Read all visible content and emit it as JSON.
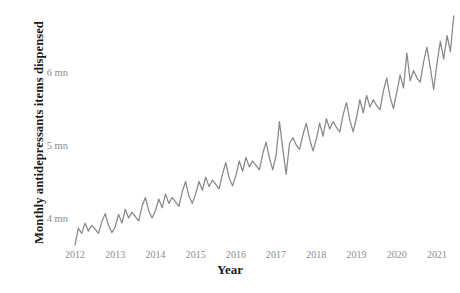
{
  "chart_data": {
    "type": "line",
    "title": "",
    "xlabel": "Year",
    "ylabel": "Monthly antidepressants items dispensed",
    "xlim": [
      2011.92,
      2021.6
    ],
    "ylim": [
      3.45,
      6.85
    ],
    "grid": false,
    "legend": false,
    "line_color": "#888888",
    "tick_color": "#8c8c8c",
    "label_color": "#1a1a1a",
    "background": "#ffffff",
    "xticks": [
      {
        "value": 2012,
        "label": "2012"
      },
      {
        "value": 2013,
        "label": "2013"
      },
      {
        "value": 2014,
        "label": "2014"
      },
      {
        "value": 2015,
        "label": "2015"
      },
      {
        "value": 2016,
        "label": "2016"
      },
      {
        "value": 2017,
        "label": "2017"
      },
      {
        "value": 2018,
        "label": "2018"
      },
      {
        "value": 2019,
        "label": "2019"
      },
      {
        "value": 2020,
        "label": "2020"
      },
      {
        "value": 2021,
        "label": "2021"
      }
    ],
    "yticks": [
      {
        "value": 4,
        "label": "4 mn"
      },
      {
        "value": 5,
        "label": "5 mn"
      },
      {
        "value": 6,
        "label": "6 mn"
      }
    ],
    "series": [
      {
        "name": "Monthly antidepressants items dispensed",
        "units": "millions of items",
        "x": [
          2012.0,
          2012.083,
          2012.167,
          2012.25,
          2012.333,
          2012.417,
          2012.5,
          2012.583,
          2012.667,
          2012.75,
          2012.833,
          2012.917,
          2013.0,
          2013.083,
          2013.167,
          2013.25,
          2013.333,
          2013.417,
          2013.5,
          2013.583,
          2013.667,
          2013.75,
          2013.833,
          2013.917,
          2014.0,
          2014.083,
          2014.167,
          2014.25,
          2014.333,
          2014.417,
          2014.5,
          2014.583,
          2014.667,
          2014.75,
          2014.833,
          2014.917,
          2015.0,
          2015.083,
          2015.167,
          2015.25,
          2015.333,
          2015.417,
          2015.5,
          2015.583,
          2015.667,
          2015.75,
          2015.833,
          2015.917,
          2016.0,
          2016.083,
          2016.167,
          2016.25,
          2016.333,
          2016.417,
          2016.5,
          2016.583,
          2016.667,
          2016.75,
          2016.833,
          2016.917,
          2017.0,
          2017.083,
          2017.167,
          2017.25,
          2017.333,
          2017.417,
          2017.5,
          2017.583,
          2017.667,
          2017.75,
          2017.833,
          2017.917,
          2018.0,
          2018.083,
          2018.167,
          2018.25,
          2018.333,
          2018.417,
          2018.5,
          2018.583,
          2018.667,
          2018.75,
          2018.833,
          2018.917,
          2019.0,
          2019.083,
          2019.167,
          2019.25,
          2019.333,
          2019.417,
          2019.5,
          2019.583,
          2019.667,
          2019.75,
          2019.833,
          2019.917,
          2020.0,
          2020.083,
          2020.167,
          2020.25,
          2020.333,
          2020.417,
          2020.5,
          2020.583,
          2020.667,
          2020.75,
          2020.833,
          2020.917,
          2021.0,
          2021.083,
          2021.167,
          2021.25,
          2021.333,
          2021.417
        ],
        "values": [
          3.63,
          3.86,
          3.79,
          3.93,
          3.82,
          3.9,
          3.85,
          3.79,
          3.95,
          4.06,
          3.9,
          3.8,
          3.88,
          4.05,
          3.93,
          4.12,
          4.0,
          4.08,
          4.02,
          3.96,
          4.16,
          4.28,
          4.1,
          4.0,
          4.1,
          4.26,
          4.14,
          4.33,
          4.2,
          4.28,
          4.22,
          4.16,
          4.36,
          4.5,
          4.3,
          4.2,
          4.33,
          4.5,
          4.38,
          4.56,
          4.43,
          4.52,
          4.46,
          4.4,
          4.6,
          4.76,
          4.55,
          4.44,
          4.58,
          4.78,
          4.64,
          4.83,
          4.7,
          4.78,
          4.72,
          4.66,
          4.88,
          5.04,
          4.82,
          4.66,
          4.86,
          5.32,
          4.94,
          4.6,
          5.02,
          5.1,
          5.0,
          4.94,
          5.14,
          5.3,
          5.08,
          4.92,
          5.08,
          5.3,
          5.12,
          5.36,
          5.22,
          5.32,
          5.24,
          5.18,
          5.42,
          5.58,
          5.34,
          5.18,
          5.38,
          5.62,
          5.44,
          5.68,
          5.52,
          5.62,
          5.54,
          5.48,
          5.74,
          5.92,
          5.66,
          5.5,
          5.72,
          5.96,
          5.78,
          6.26,
          5.88,
          6.02,
          5.92,
          5.86,
          6.14,
          6.34,
          6.06,
          5.76,
          6.12,
          6.42,
          6.18,
          6.5,
          6.28,
          6.77
        ]
      }
    ]
  }
}
